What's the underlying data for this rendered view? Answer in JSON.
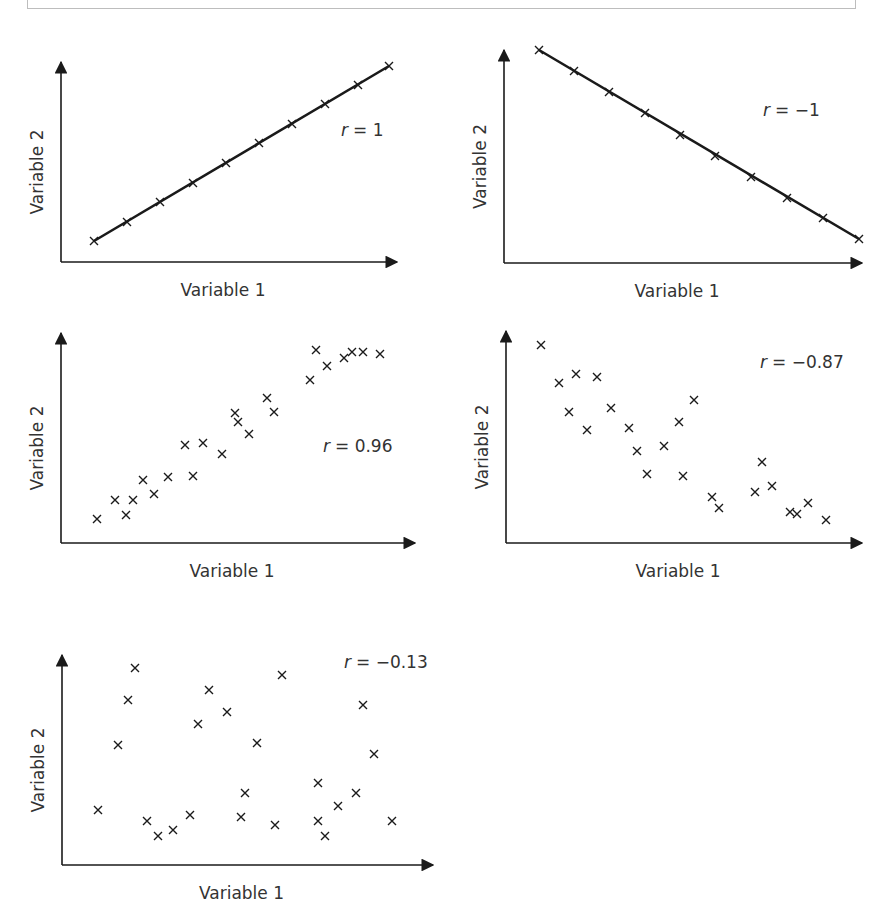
{
  "figure": {
    "colors": {
      "ink": "#1a1a1a",
      "text": "#333333",
      "frame": "#bdbdbd"
    }
  },
  "chart_data": [
    {
      "id": "chart-r1",
      "type": "scatter",
      "title": "",
      "annotation": "r = 1",
      "annotation_r": "r",
      "annotation_value": "= 1",
      "xlabel": "Variable 1",
      "ylabel": "Variable 2",
      "xlim": [
        0,
        10
      ],
      "ylim": [
        0,
        10
      ],
      "grid": false,
      "fit_line": true,
      "box": {
        "ox": 61,
        "oy": 262,
        "xend": 397,
        "ytop": 62
      },
      "label_pos": {
        "x": 341,
        "y": 136
      },
      "points": [
        [
          1,
          1.0
        ],
        [
          2,
          2.0
        ],
        [
          3,
          3.0
        ],
        [
          4,
          4.0
        ],
        [
          5,
          5.0
        ],
        [
          6,
          6.0
        ],
        [
          7,
          7.0
        ],
        [
          8,
          8.0
        ],
        [
          9,
          9.0
        ]
      ],
      "px": [
        [
          94,
          241
        ],
        [
          127,
          222
        ],
        [
          160,
          202
        ],
        [
          193,
          183
        ],
        [
          226,
          163
        ],
        [
          259,
          143
        ],
        [
          292,
          124
        ],
        [
          325,
          104
        ],
        [
          358,
          85
        ],
        [
          389,
          66
        ]
      ]
    },
    {
      "id": "chart-rneg1",
      "type": "scatter",
      "title": "",
      "annotation": "r = −1",
      "annotation_r": "r",
      "annotation_value": "= −1",
      "xlabel": "Variable 1",
      "ylabel": "Variable 2",
      "xlim": [
        0,
        10
      ],
      "ylim": [
        0,
        10
      ],
      "grid": false,
      "fit_line": true,
      "box": {
        "ox": 504,
        "oy": 263,
        "xend": 862,
        "ytop": 50
      },
      "label_pos": {
        "x": 763,
        "y": 116
      },
      "points": [
        [
          1,
          10
        ],
        [
          2,
          9
        ],
        [
          3,
          8
        ],
        [
          4,
          7
        ],
        [
          5,
          6
        ],
        [
          6,
          5
        ],
        [
          7,
          4
        ],
        [
          8,
          3
        ],
        [
          9,
          2
        ],
        [
          10,
          1
        ]
      ],
      "px": [
        [
          539,
          50
        ],
        [
          574,
          71
        ],
        [
          609,
          92
        ],
        [
          645,
          113
        ],
        [
          680,
          135
        ],
        [
          715,
          156
        ],
        [
          751,
          177
        ],
        [
          787,
          198
        ],
        [
          823,
          218
        ],
        [
          859,
          239
        ]
      ]
    },
    {
      "id": "chart-r096",
      "type": "scatter",
      "title": "",
      "annotation": "r = 0.96",
      "annotation_r": "r",
      "annotation_value": "= 0.96",
      "xlabel": "Variable 1",
      "ylabel": "Variable 2",
      "xlim": [
        0,
        10
      ],
      "ylim": [
        0,
        10
      ],
      "grid": false,
      "fit_line": false,
      "box": {
        "ox": 61,
        "oy": 543,
        "xend": 415,
        "ytop": 333
      },
      "label_pos": {
        "x": 323,
        "y": 452
      },
      "points": [
        [
          1.0,
          1.1
        ],
        [
          1.5,
          2.0
        ],
        [
          1.8,
          1.3
        ],
        [
          2.0,
          2.0
        ],
        [
          2.3,
          2.9
        ],
        [
          2.6,
          2.3
        ],
        [
          3.0,
          3.0
        ],
        [
          3.6,
          3.1
        ],
        [
          3.4,
          4.6
        ],
        [
          3.9,
          4.7
        ],
        [
          4.4,
          4.2
        ],
        [
          4.9,
          5.9
        ],
        [
          5.0,
          5.5
        ],
        [
          5.3,
          5.0
        ],
        [
          5.8,
          6.5
        ],
        [
          6.0,
          6.0
        ],
        [
          7.0,
          7.8
        ],
        [
          7.2,
          9.0
        ],
        [
          7.5,
          8.6
        ],
        [
          8.0,
          8.8
        ],
        [
          8.2,
          9.1
        ],
        [
          8.5,
          9.1
        ],
        [
          9.0,
          9.0
        ]
      ],
      "px": [
        [
          97,
          519
        ],
        [
          115,
          500
        ],
        [
          126,
          515
        ],
        [
          133,
          500
        ],
        [
          143,
          480
        ],
        [
          154,
          494
        ],
        [
          168,
          477
        ],
        [
          193,
          476
        ],
        [
          185,
          445
        ],
        [
          203,
          443
        ],
        [
          222,
          454
        ],
        [
          235,
          413
        ],
        [
          238,
          422
        ],
        [
          249,
          434
        ],
        [
          267,
          398
        ],
        [
          274,
          412
        ],
        [
          310,
          380
        ],
        [
          316,
          350
        ],
        [
          327,
          366
        ],
        [
          344,
          358
        ],
        [
          352,
          352
        ],
        [
          363,
          352
        ],
        [
          380,
          354
        ]
      ]
    },
    {
      "id": "chart-rneg087",
      "type": "scatter",
      "title": "",
      "annotation": "r = −0.87",
      "annotation_r": "r",
      "annotation_value": "= −0.87",
      "xlabel": "Variable 1",
      "ylabel": "Variable 2",
      "xlim": [
        0,
        10
      ],
      "ylim": [
        0,
        10
      ],
      "grid": false,
      "fit_line": false,
      "box": {
        "ox": 506,
        "oy": 543,
        "xend": 862,
        "ytop": 331
      },
      "label_pos": {
        "x": 760,
        "y": 368
      },
      "points": [
        [
          1.0,
          9.1
        ],
        [
          1.5,
          7.6
        ],
        [
          1.7,
          6.5
        ],
        [
          1.9,
          8.0
        ],
        [
          2.1,
          5.6
        ],
        [
          2.6,
          7.8
        ],
        [
          3.0,
          6.3
        ],
        [
          3.5,
          5.6
        ],
        [
          3.7,
          4.7
        ],
        [
          4.0,
          3.2
        ],
        [
          4.4,
          5.0
        ],
        [
          4.7,
          5.8
        ],
        [
          5.0,
          3.3
        ],
        [
          5.4,
          6.8
        ],
        [
          5.8,
          2.2
        ],
        [
          6.0,
          1.8
        ],
        [
          7.2,
          2.4
        ],
        [
          7.4,
          4.1
        ],
        [
          7.7,
          2.8
        ],
        [
          8.4,
          1.4
        ],
        [
          8.6,
          1.3
        ],
        [
          8.9,
          1.9
        ],
        [
          9.5,
          1.1
        ]
      ],
      "px": [
        [
          541,
          345
        ],
        [
          559,
          383
        ],
        [
          569,
          412
        ],
        [
          576,
          374
        ],
        [
          587,
          430
        ],
        [
          597,
          377
        ],
        [
          611,
          408
        ],
        [
          629,
          428
        ],
        [
          637,
          451
        ],
        [
          647,
          474
        ],
        [
          664,
          446
        ],
        [
          679,
          422
        ],
        [
          683,
          476
        ],
        [
          694,
          400
        ],
        [
          712,
          497
        ],
        [
          719,
          508
        ],
        [
          755,
          492
        ],
        [
          762,
          462
        ],
        [
          772,
          486
        ],
        [
          790,
          512
        ],
        [
          797,
          514
        ],
        [
          808,
          503
        ],
        [
          826,
          520
        ]
      ]
    },
    {
      "id": "chart-rneg013",
      "type": "scatter",
      "title": "",
      "annotation": "r = −0.13",
      "annotation_r": "r",
      "annotation_value": "= −0.13",
      "xlabel": "Variable 1",
      "ylabel": "Variable 2",
      "xlim": [
        0,
        10
      ],
      "ylim": [
        0,
        10
      ],
      "grid": false,
      "fit_line": false,
      "box": {
        "ox": 62,
        "oy": 865,
        "xend": 433,
        "ytop": 655
      },
      "label_pos": {
        "x": 344,
        "y": 668
      },
      "points": [
        [
          1.0,
          2.5
        ],
        [
          1.5,
          5.8
        ],
        [
          1.8,
          8.0
        ],
        [
          2.0,
          9.3
        ],
        [
          2.3,
          1.9
        ],
        [
          2.6,
          1.4
        ],
        [
          3.0,
          1.7
        ],
        [
          3.4,
          2.3
        ],
        [
          3.7,
          6.9
        ],
        [
          4.0,
          8.5
        ],
        [
          4.5,
          7.5
        ],
        [
          5.0,
          5.8
        ],
        [
          5.0,
          3.1
        ],
        [
          5.0,
          1.9
        ],
        [
          5.8,
          1.6
        ],
        [
          6.0,
          9.0
        ],
        [
          6.9,
          3.5
        ],
        [
          7.0,
          1.8
        ],
        [
          7.1,
          1.2
        ],
        [
          7.5,
          2.4
        ],
        [
          8.0,
          3.0
        ],
        [
          8.2,
          7.4
        ],
        [
          8.5,
          5.1
        ],
        [
          9.0,
          1.8
        ]
      ],
      "px": [
        [
          98,
          810
        ],
        [
          118,
          745
        ],
        [
          128,
          700
        ],
        [
          135,
          668
        ],
        [
          147,
          821
        ],
        [
          158,
          836
        ],
        [
          173,
          830
        ],
        [
          190,
          815
        ],
        [
          198,
          724
        ],
        [
          209,
          690
        ],
        [
          227,
          712
        ],
        [
          257,
          743
        ],
        [
          245,
          793
        ],
        [
          241,
          817
        ],
        [
          275,
          825
        ],
        [
          282,
          675
        ],
        [
          318,
          783
        ],
        [
          318,
          821
        ],
        [
          325,
          836
        ],
        [
          338,
          806
        ],
        [
          356,
          793
        ],
        [
          363,
          705
        ],
        [
          374,
          754
        ],
        [
          392,
          821
        ]
      ]
    }
  ]
}
